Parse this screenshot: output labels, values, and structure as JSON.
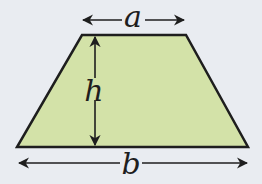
{
  "diagram": {
    "labels": {
      "top_base": "a",
      "height": "h",
      "bottom_base": "b"
    },
    "colors": {
      "background": "#e9ecf1",
      "fill": "#d3e2a8",
      "stroke": "#1e1e1e"
    },
    "shape": {
      "vertices": [
        [
          82,
          35
        ],
        [
          186,
          35
        ],
        [
          248,
          147
        ],
        [
          17,
          147
        ]
      ]
    }
  }
}
